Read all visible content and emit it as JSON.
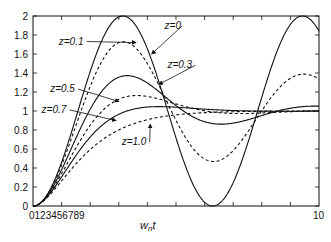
{
  "chart_data": {
    "type": "line",
    "title": "",
    "xlabel": "w_n t",
    "xlabel_main": "w",
    "xlabel_sub": "n",
    "xlabel_tail": "t",
    "ylabel": "",
    "xlim": [
      0,
      10
    ],
    "ylim": [
      0,
      2
    ],
    "grid": false,
    "legend": "annotations with arrows",
    "x_tick_labels": [
      "0",
      "1",
      "2",
      "3",
      "4",
      "5",
      "6",
      "7",
      "8",
      "9",
      "10"
    ],
    "x_tick_label_left_run": "0123456789",
    "x_tick_label_right": "10",
    "y_ticks": [
      0,
      0.2,
      0.4,
      0.6,
      0.8,
      1,
      1.2,
      1.4,
      1.6,
      1.8,
      2
    ],
    "y_tick_labels": [
      "0",
      "0.2",
      "0.4",
      "0.6",
      "0.8",
      "1",
      "1.2",
      "1.4",
      "1.6",
      "1.8",
      "2"
    ],
    "series": [
      {
        "name": "z=0",
        "zeta": 0,
        "style": "solid",
        "peak": 2.0
      },
      {
        "name": "z=0.1",
        "zeta": 0.1,
        "style": "dashed",
        "peak": 1.73
      },
      {
        "name": "z=0.3",
        "zeta": 0.3,
        "style": "solid",
        "peak": 1.37
      },
      {
        "name": "z=0.5",
        "zeta": 0.5,
        "style": "dashed",
        "peak": 1.16
      },
      {
        "name": "z=0.7",
        "zeta": 0.7,
        "style": "solid",
        "peak": 1.05
      },
      {
        "name": "z=1.0",
        "zeta": 1.0,
        "style": "dashed",
        "peak": 1.0
      }
    ],
    "annotations": [
      {
        "text": "z=0",
        "x": 4.6,
        "y": 1.86,
        "arrow_to": [
          4.15,
          1.6
        ]
      },
      {
        "text": "z=0.1",
        "x": 0.9,
        "y": 1.7,
        "arrow_to": [
          3.6,
          1.72
        ]
      },
      {
        "text": "z=0.3",
        "x": 4.7,
        "y": 1.45,
        "arrow_to": [
          4.4,
          1.28
        ]
      },
      {
        "text": "z=0.5",
        "x": 0.6,
        "y": 1.2,
        "arrow_to": [
          3.0,
          1.1
        ]
      },
      {
        "text": "z=0.7",
        "x": 0.3,
        "y": 0.98,
        "arrow_to": [
          2.9,
          0.9
        ]
      },
      {
        "text": "z=1.0",
        "x": 3.1,
        "y": 0.64,
        "arrow_to": [
          4.1,
          0.86
        ]
      }
    ]
  }
}
